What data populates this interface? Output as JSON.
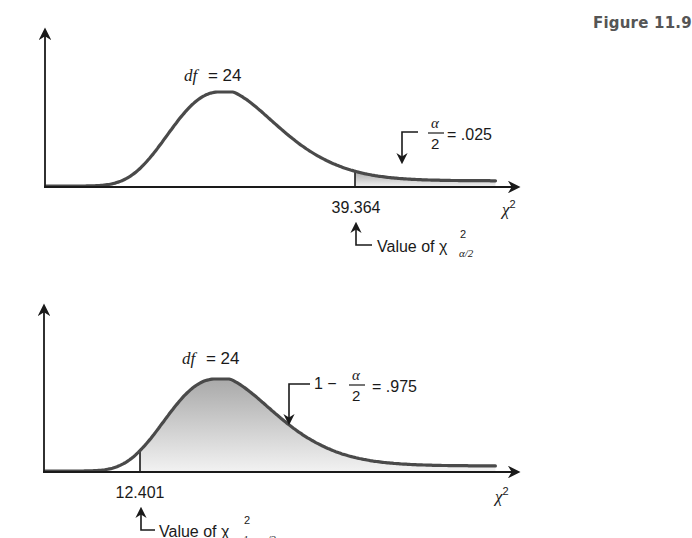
{
  "figure": {
    "title": "Figure 11.9"
  },
  "colors": {
    "curve": "#4a4a4a",
    "axis": "#1a1a1a",
    "shade_top": "#a9a9a9",
    "shade_bottom": "#f2f2f2",
    "background": "#ffffff",
    "title": "#555555"
  },
  "chart_data": [
    {
      "type": "area",
      "title": "Chi-square distribution, upper tail",
      "distribution": "chi-square",
      "df": 24,
      "df_label_var": "df",
      "df_label_eq": "= 24",
      "xlabel": "χ²",
      "ylabel": "",
      "critical_value": 39.364,
      "critical_value_label": "39.364",
      "shaded_region": "right tail (x ≥ 39.364)",
      "shaded_area": 0.025,
      "annotation": {
        "numerator": "α",
        "denominator": "2",
        "eq": "= .025"
      },
      "pointer_label": {
        "text": "Value of χ",
        "sup": "2",
        "sub": "α/2"
      },
      "grid": false,
      "legend": null
    },
    {
      "type": "area",
      "title": "Chi-square distribution, lower-tail complement",
      "distribution": "chi-square",
      "df": 24,
      "df_label_var": "df",
      "df_label_eq": "= 24",
      "xlabel": "χ²",
      "ylabel": "",
      "critical_value": 12.401,
      "critical_value_label": "12.401",
      "shaded_region": "right of critical value (x ≥ 12.401)",
      "shaded_area": 0.975,
      "annotation": {
        "prefix": "1 −",
        "numerator": "α",
        "denominator": "2",
        "eq": "= .975"
      },
      "pointer_label": {
        "text": "Value of χ",
        "sup": "2",
        "sub": "1 − α/2"
      },
      "grid": false,
      "legend": null
    }
  ]
}
